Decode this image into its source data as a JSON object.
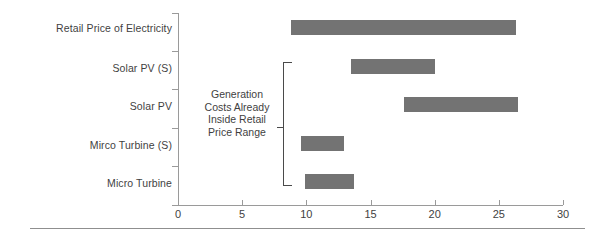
{
  "chart_data": {
    "type": "bar",
    "orientation": "horizontal",
    "subtype": "range-bar",
    "title": "",
    "xlabel": "",
    "ylabel": "",
    "xlim": [
      0,
      30
    ],
    "xticks": [
      0,
      5,
      10,
      15,
      20,
      25,
      30
    ],
    "xtick_labels": [
      "0",
      "5",
      "10",
      "15",
      "20",
      "25",
      "30"
    ],
    "grid": false,
    "legend": null,
    "bar_color": "#737373",
    "axis_color": "#9a9a9a",
    "categories": [
      "Retail Price of Electricity",
      "Solar PV (S)",
      "Solar PV",
      "Mirco Turbine (S)",
      "Micro Turbine"
    ],
    "ranges": [
      {
        "label": "Retail Price of Electricity",
        "start": 8.8,
        "end": 26.3
      },
      {
        "label": "Solar PV (S)",
        "start": 13.5,
        "end": 20.0
      },
      {
        "label": "Solar PV",
        "start": 17.6,
        "end": 26.5
      },
      {
        "label": "Mirco Turbine (S)",
        "start": 9.6,
        "end": 12.9
      },
      {
        "label": "Micro Turbine",
        "start": 9.9,
        "end": 13.7
      }
    ],
    "annotations": [
      {
        "name": "generation-costs-note",
        "text": "Generation\nCosts Already\nInside Retail\nPrice Range",
        "covers": [
          "Solar PV (S)",
          "Solar PV",
          "Mirco Turbine (S)",
          "Micro Turbine"
        ]
      }
    ]
  }
}
